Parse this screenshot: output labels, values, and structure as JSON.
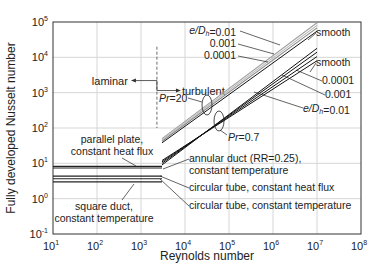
{
  "chart_data": {
    "type": "line",
    "title": "",
    "xlabel": "Reynolds number",
    "ylabel": "Fully developed Nusselt number",
    "xscale": "log",
    "yscale": "log",
    "xlim": [
      10,
      100000000
    ],
    "ylim": [
      0.1,
      100000
    ],
    "grid": true,
    "x_ticks": [
      {
        "base": "10",
        "exp": "1"
      },
      {
        "base": "10",
        "exp": "2"
      },
      {
        "base": "10",
        "exp": "3"
      },
      {
        "base": "10",
        "exp": "4"
      },
      {
        "base": "10",
        "exp": "5"
      },
      {
        "base": "10",
        "exp": "6"
      },
      {
        "base": "10",
        "exp": "7"
      },
      {
        "base": "10",
        "exp": "8"
      }
    ],
    "y_ticks": [
      {
        "base": "10",
        "exp": "-1"
      },
      {
        "base": "10",
        "exp": "0"
      },
      {
        "base": "10",
        "exp": "1"
      },
      {
        "base": "10",
        "exp": "2"
      },
      {
        "base": "10",
        "exp": "3"
      },
      {
        "base": "10",
        "exp": "4"
      },
      {
        "base": "10",
        "exp": "5"
      }
    ],
    "transition_Re": 2300,
    "regime_labels": {
      "laminar": "laminar",
      "turbulent": "turbulent"
    },
    "laminar_series": [
      {
        "name": "parallel plate, constant heat flux",
        "Nu": 8.23,
        "Re_range": [
          10,
          3000
        ]
      },
      {
        "name": "annular duct (RR=0.25), constant temperature",
        "Nu": 7.37,
        "Re_range": [
          10,
          3000
        ]
      },
      {
        "name": "circular tube, constant heat flux",
        "Nu": 4.36,
        "Re_range": [
          10,
          3000
        ]
      },
      {
        "name": "circular tube, constant temperature",
        "Nu": 3.66,
        "Re_range": [
          10,
          3000
        ]
      },
      {
        "name": "square duct, constant temperature",
        "Nu": 2.98,
        "Re_range": [
          10,
          3000
        ]
      }
    ],
    "turbulent_series": [
      {
        "name": "Pr=20, e/Dh=0.01",
        "group": "Pr=20",
        "x": [
          3000,
          10000000
        ],
        "y": [
          50,
          95000
        ],
        "color": "#a0a0a0"
      },
      {
        "name": "Pr=20, e/Dh=0.001",
        "group": "Pr=20",
        "x": [
          3000,
          10000000
        ],
        "y": [
          46,
          80000
        ],
        "color": "#b8b8b8"
      },
      {
        "name": "Pr=20, e/Dh=0.0001",
        "group": "Pr=20",
        "x": [
          3000,
          10000000
        ],
        "y": [
          42,
          68000
        ],
        "color": "#8a8a8a"
      },
      {
        "name": "Pr=20, smooth",
        "group": "Pr=20",
        "x": [
          3000,
          10000000
        ],
        "y": [
          38,
          55000
        ],
        "color": "#111111"
      },
      {
        "name": "Pr=0.7, smooth",
        "group": "Pr=0.7",
        "x": [
          3000,
          10000000
        ],
        "y": [
          9,
          18000
        ],
        "color": "#111111"
      },
      {
        "name": "Pr=0.7, e/Dh=0.0001",
        "group": "Pr=0.7",
        "x": [
          3000,
          10000000
        ],
        "y": [
          10,
          14000
        ],
        "color": "#111111"
      },
      {
        "name": "Pr=0.7, e/Dh=0.001",
        "group": "Pr=0.7",
        "x": [
          3000,
          10000000
        ],
        "y": [
          11,
          10500
        ],
        "color": "#111111"
      },
      {
        "name": "Pr=0.7, e/Dh=0.01",
        "group": "Pr=0.7",
        "x": [
          3000,
          10000000
        ],
        "y": [
          12,
          8000
        ],
        "color": "#111111"
      }
    ],
    "annotations": {
      "top_left": [
        "e/Dh=0.01",
        "0.001",
        "0.0001"
      ],
      "top_right_smooth1": "smooth",
      "top_right_smooth2": "smooth",
      "right_0001": "0.0001",
      "right_001": "0.001",
      "right_01": "e/Dh=0.01",
      "pr20": "Pr=20",
      "pr07": "Pr=0.7",
      "parallel_plate": [
        "parallel plate,",
        "constant heat flux"
      ],
      "annular": [
        "annular duct (RR=0.25),",
        "constant temperature"
      ],
      "circ_flux": "circular tube, constant heat flux",
      "circ_temp": "circular tube, constant temperature",
      "square": [
        "square duct,",
        "constant temperature"
      ]
    }
  }
}
